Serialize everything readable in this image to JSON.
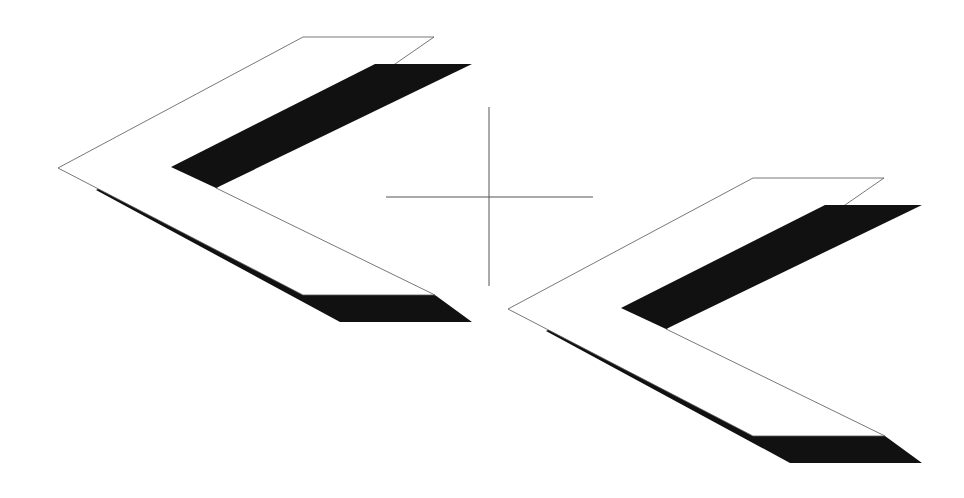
{
  "diagram": {
    "title": "",
    "background": "#ffffff",
    "colors": {
      "face_fill": "#ffffff",
      "face_stroke": "#555555",
      "shadow": "#111111",
      "crosshair": "#555555"
    },
    "chevrons": [
      {
        "name": "chevron-left",
        "offset": [
          0,
          0
        ]
      },
      {
        "name": "chevron-right",
        "offset": [
          450,
          141
        ]
      }
    ],
    "shape": {
      "face": [
        [
          58,
          168
        ],
        [
          303,
          37
        ],
        [
          434,
          37
        ],
        [
          216,
          188
        ],
        [
          435,
          295
        ],
        [
          303,
          295
        ]
      ],
      "shadow_upper": [
        [
          375,
          64
        ],
        [
          472,
          64
        ],
        [
          216,
          188
        ],
        [
          171,
          167
        ]
      ],
      "shadow_lower": [
        [
          96,
          190
        ],
        [
          102,
          187
        ],
        [
          303,
          295
        ],
        [
          435,
          295
        ],
        [
          472,
          322
        ],
        [
          340,
          322
        ]
      ]
    },
    "crosshair": {
      "center": [
        489,
        197
      ],
      "horizontal": [
        [
          386,
          197
        ],
        [
          593,
          197
        ]
      ],
      "vertical": [
        [
          489,
          107
        ],
        [
          489,
          286
        ]
      ]
    }
  }
}
